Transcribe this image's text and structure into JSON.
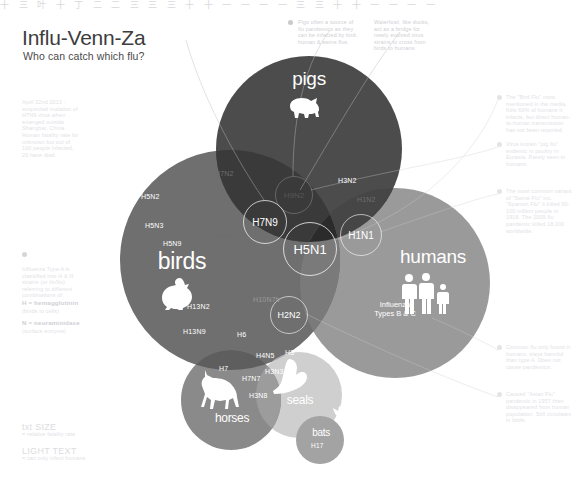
{
  "topstrip": "十 三 叶 十 丁 二 二 三   三 三   十 十 一 一 一   一 三 三   十 十 一 一 一 一",
  "header": {
    "title": "Influ-Venn-Za",
    "subtitle": "Who can catch which flu?"
  },
  "sidebar_left": {
    "credit": "April 22nd 2013 : suspected mutation of H7N9 virus when emerged outside Shanghai, China. Human fatality rate for unknown but out of 100 people infected, 20 have died.",
    "legend_note": {
      "intro": "Influenza Type A is classified into H & N strains (or HxNx) referring to different combinations of:",
      "h_label": "H = hemagglutinin",
      "h_sub": "(binds to cells)",
      "n_label": "N = neuraminidase",
      "n_sub": "(surface enzyme)"
    },
    "key": [
      {
        "head": "txt SIZE",
        "sub": "= relative fatality rate"
      },
      {
        "head": "LIGHT TEXT",
        "sub": "= can only infect humans"
      }
    ]
  },
  "annotations_top": [
    "Pigs often a source of flu pandemics as they can be infected by bird, human & swine flus.",
    "Waterfowl, like ducks, act as a bridge for newly evolved virus strains to cross from birds to humans."
  ],
  "annotations_right": [
    "The \"Bird Flu\" most mentioned in the media. Kills 60% of humans it infects, but direct human-to-human transmission has not been reported.",
    "Virus known \"pig flu\" endemic in poultry in Eurasia. Rarely seen in humans.",
    "The most common variant of \"Swine Flu\" inc. \"Spanish Flu\" it killed 50-100 million people in 1918. The 2009 flu pandemic killed 18,000 worldwide.",
    "Common flu only found in humans, stays harmful than type A. Does not cause pandemics.",
    "Caused \"Asian Flu\" pandemic in 1957 then disappeared from human population. Still circulates in birds."
  ],
  "venn": {
    "circles": [
      {
        "name": "pigs",
        "label": "pigs",
        "color": "#4c4c4c",
        "icon": "pig-icon"
      },
      {
        "name": "birds",
        "label": "birds",
        "color": "#6f6f6f",
        "icon": "chicken-icon"
      },
      {
        "name": "humans",
        "label": "humans",
        "color": "#9a9a9a",
        "icon": "people-icon"
      },
      {
        "name": "horses",
        "label": "horses",
        "color": "#8a8a8a",
        "icon": "horse-icon"
      },
      {
        "name": "seals",
        "label": "seals",
        "color": "#cfcfcf",
        "icon": "seal-icon"
      },
      {
        "name": "bats",
        "label": "bats",
        "color": "#a3a3a3",
        "icon": "bat-icon"
      }
    ],
    "highlighted": [
      {
        "id": "h5n1",
        "label": "H5N1"
      },
      {
        "id": "h7n9",
        "label": "H7N9"
      },
      {
        "id": "h9n2",
        "label": "H9N2"
      },
      {
        "id": "h1n1",
        "label": "H1N1"
      },
      {
        "id": "h2n2",
        "label": "H2N2"
      }
    ],
    "strains": {
      "birds_only": [
        "H5N2",
        "H5N3",
        "H5N9",
        "H13N2",
        "H13N9",
        "H6"
      ],
      "pigs_birds": [
        "H7N2",
        "H10N7",
        "H10N7b"
      ],
      "pigs_humans": [
        "H3N2"
      ],
      "birds_humans": [
        "H7N3"
      ],
      "humans_only": [
        "H1N2"
      ],
      "birds_horses": [
        "H7",
        "H7N7"
      ],
      "horses_seals": [
        "H3N8"
      ],
      "birds_seals": [
        "H4N5",
        "H3N3"
      ],
      "seals_humans": [
        "H3"
      ],
      "bats_only": [
        "H17"
      ]
    },
    "humans_note": "Influenza\nTypes B & C"
  }
}
